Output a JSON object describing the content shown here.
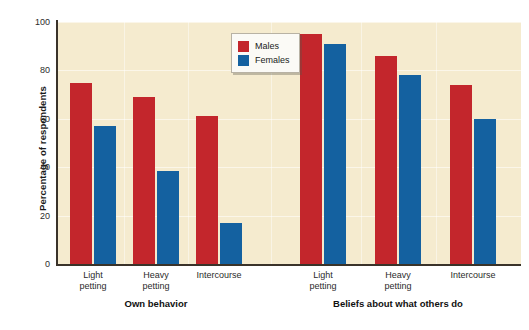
{
  "chart_data": {
    "type": "bar",
    "title": "",
    "xlabel": "",
    "ylabel": "Percentage of respondents",
    "ylim": [
      0,
      100
    ],
    "ytick_labels": [
      "0",
      "20",
      "40",
      "60",
      "80",
      "100"
    ],
    "ytick_values": [
      0,
      20,
      40,
      60,
      80,
      100
    ],
    "grid": true,
    "legend_position": "top-center-left",
    "categories": [
      "Light petting",
      "Heavy petting",
      "Intercourse"
    ],
    "panels": [
      {
        "label": "Own behavior",
        "categories": [
          "Light petting",
          "Heavy petting",
          "Intercourse"
        ],
        "series": [
          {
            "name": "Males",
            "values": [
              75,
              69,
              61
            ]
          },
          {
            "name": "Females",
            "values": [
              57,
              38.5,
              17
            ]
          }
        ]
      },
      {
        "label": "Beliefs about what others do",
        "categories": [
          "Light petting",
          "Heavy petting",
          "Intercourse"
        ],
        "series": [
          {
            "name": "Males",
            "values": [
              95,
              86,
              74
            ]
          },
          {
            "name": "Females",
            "values": [
              91,
              78,
              60
            ]
          }
        ]
      }
    ],
    "series_colors": {
      "Males": "#C3262C",
      "Females": "#1461A0"
    },
    "plot_background": "#F5EBCF",
    "page_background": "#FFFFFF"
  },
  "legend": {
    "items": [
      {
        "label": "Males",
        "color": "#C3262C"
      },
      {
        "label": "Females",
        "color": "#1461A0"
      }
    ]
  },
  "axes": {
    "y_title": "Percentage of respondents"
  },
  "xlabels": {
    "line1": [
      "Light",
      "Heavy",
      "Intercourse",
      "Light",
      "Heavy",
      "Intercourse"
    ],
    "line2": [
      "petting",
      "petting",
      "",
      "petting",
      "petting",
      ""
    ]
  },
  "panel_labels": [
    "Own behavior",
    "Beliefs about what others do"
  ]
}
